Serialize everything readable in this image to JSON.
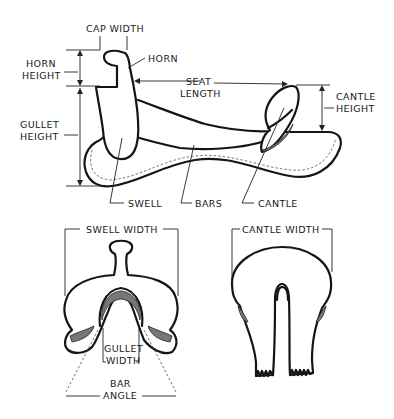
{
  "diagram": {
    "side_view": {
      "labels": {
        "cap_width": "CAP WIDTH",
        "horn": "HORN",
        "horn_height_1": "HORN",
        "horn_height_2": "HEIGHT",
        "seat_length_1": "SEAT",
        "seat_length_2": "LENGTH",
        "cantle_height_1": "CANTLE",
        "cantle_height_2": "HEIGHT",
        "gullet_height_1": "GULLET",
        "gullet_height_2": "HEIGHT",
        "swell": "SWELL",
        "bars": "BARS",
        "cantle": "CANTLE"
      }
    },
    "front_view": {
      "labels": {
        "swell_width": "SWELL WIDTH",
        "gullet_width_1": "GULLET",
        "gullet_width_2": "WIDTH",
        "bar_angle_1": "BAR",
        "bar_angle_2": "ANGLE"
      }
    },
    "rear_view": {
      "labels": {
        "cantle_width": "CANTLE WIDTH"
      }
    },
    "colors": {
      "ink": "#151515",
      "background": "#ffffff"
    }
  }
}
